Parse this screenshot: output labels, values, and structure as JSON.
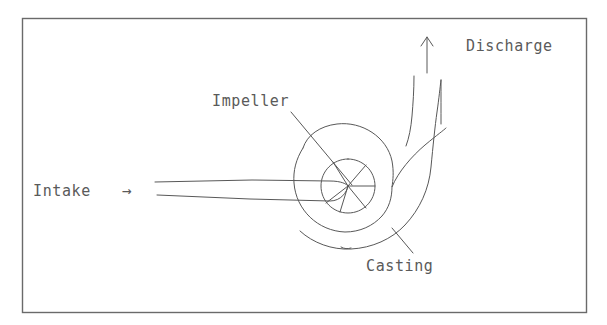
{
  "figure": {
    "kind": "hand-drawn-technical-diagram",
    "background_color": "#ffffff",
    "line_color": "#585858",
    "frame_color": "#6a6a6a",
    "text_color": "#5a5a5a",
    "frame": {
      "x": 22,
      "y": 18,
      "width": 564,
      "height": 294
    }
  },
  "labels": {
    "intake": "Intake",
    "intake_arrow": "→",
    "impeller": "Impeller",
    "casting": "Casting",
    "discharge": "Discharge"
  },
  "label_positions": {
    "intake": {
      "x": 33,
      "y": 196
    },
    "intake_arrow": {
      "x": 122,
      "y": 196
    },
    "impeller": {
      "x": 212,
      "y": 106
    },
    "casting": {
      "x": 366,
      "y": 271
    },
    "discharge": {
      "x": 466,
      "y": 51
    }
  },
  "components": [
    {
      "name": "intake-pipe",
      "label": "Intake",
      "description": "horizontal suction pipe entering impeller eye from the left"
    },
    {
      "name": "impeller",
      "label": "Impeller",
      "description": "vaned rotor circle at center with radial blades"
    },
    {
      "name": "volute-casing",
      "label": "Casting",
      "description": "spiral volute casing surrounding the impeller"
    },
    {
      "name": "discharge-pipe",
      "label": "Discharge",
      "description": "vertical outlet pipe rising from the volute with up arrow"
    }
  ],
  "geometry": {
    "impeller_center": {
      "x": 348,
      "y": 186
    },
    "impeller_radius": 27,
    "volute_inner_radius": 45,
    "discharge_arrow": {
      "x": 427,
      "y_tail": 73,
      "y_head": 37
    }
  }
}
